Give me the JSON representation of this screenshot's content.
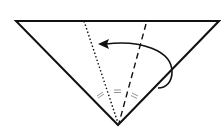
{
  "diagram": {
    "type": "origami-fold-step",
    "colors": {
      "line": "#111111",
      "angle_marks": "#888888",
      "background": "#ffffff"
    },
    "shape": "inverted-triangle",
    "fold_lines": [
      {
        "kind": "valley-fold",
        "style": "dashed"
      },
      {
        "kind": "reference-line",
        "style": "dotted"
      }
    ],
    "arrow": {
      "direction": "fold-left",
      "style": "curved"
    },
    "angle_marks": {
      "count": 3,
      "meaning": "equal-angles"
    }
  }
}
